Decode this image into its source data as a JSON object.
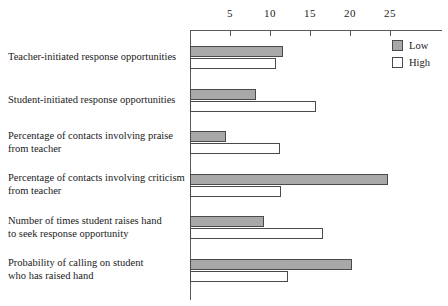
{
  "chart_data": {
    "type": "bar",
    "orientation": "horizontal",
    "title": "",
    "xlabel": "",
    "ylabel": "",
    "xlim": [
      0,
      31.5
    ],
    "grid": false,
    "legend_position": "top-right",
    "tick_labels": [
      "5",
      "10",
      "15",
      "20",
      "25"
    ],
    "tick_values": [
      5,
      10,
      15,
      20,
      25
    ],
    "categories": [
      "Teacher-initiated response opportunities",
      "Student-initiated response  opportunities",
      "Percentage of contacts involving praise from teacher",
      "Percentage of contacts involving criticism from teacher",
      "Number of times student raises hand to seek response opportunity",
      "Probability of calling on student who has raised hand"
    ],
    "category_lines": [
      [
        "Teacher-initiated response opportunities"
      ],
      [
        "Student-initiated response  opportunities"
      ],
      [
        "Percentage of contacts involving praise",
        "from teacher"
      ],
      [
        "Percentage of contacts involving criticism",
        "from teacher"
      ],
      [
        "Number of times student raises hand",
        "to seek response opportunity"
      ],
      [
        "Probability of calling on student",
        "who has raised hand"
      ]
    ],
    "series": [
      {
        "name": "Low",
        "color": "#a8a8a8",
        "values": [
          11.6,
          8.2,
          4.5,
          24.8,
          9.2,
          20.2
        ]
      },
      {
        "name": "High",
        "color": "#ffffff",
        "values": [
          10.7,
          15.7,
          11.2,
          11.4,
          16.6,
          12.3
        ]
      }
    ]
  },
  "legend": {
    "items": [
      {
        "label": "Low",
        "color": "#a8a8a8"
      },
      {
        "label": "High",
        "color": "#ffffff"
      }
    ]
  }
}
